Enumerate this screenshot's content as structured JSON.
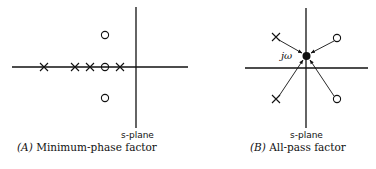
{
  "panels": [
    {
      "id": "A",
      "caption_letter": "(A)",
      "caption_text": "Minimum-phase factor",
      "plane_label": "s-plane",
      "poles_marker": "x",
      "zeros_marker": "o",
      "poles_real_axis": 4,
      "zeros": 3
    },
    {
      "id": "B",
      "caption_letter": "(B)",
      "caption_text": "All-pass factor",
      "plane_label": "s-plane",
      "point_label": "jω",
      "poles": 2,
      "zeros": 2,
      "point_marker": "filled-dot"
    }
  ]
}
